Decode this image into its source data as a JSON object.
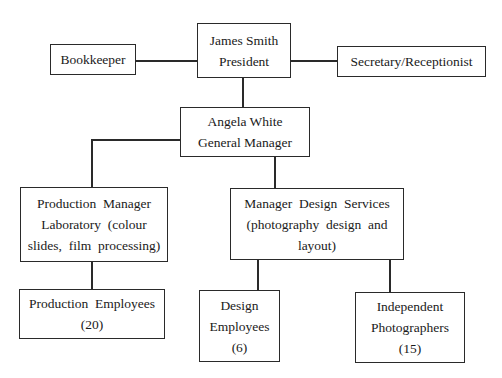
{
  "diagram": {
    "type": "org-chart",
    "nodes": {
      "president": {
        "lines": [
          "James Smith",
          "President"
        ]
      },
      "bookkeeper": {
        "lines": [
          "Bookkeeper"
        ]
      },
      "secretary": {
        "lines": [
          "Secretary/Receptionist"
        ]
      },
      "general_manager": {
        "lines": [
          "Angela White",
          "General Manager"
        ]
      },
      "production_manager": {
        "lines": [
          "Production  Manager",
          "Laboratory  (colour",
          "slides,  film  processing)"
        ]
      },
      "design_manager": {
        "lines": [
          "Manager  Design  Services",
          "(photography  design  and",
          "layout)"
        ]
      },
      "production_employees": {
        "lines": [
          "Production  Employees",
          "(20)"
        ]
      },
      "design_employees": {
        "lines": [
          "Design",
          "Employees",
          "(6)"
        ]
      },
      "independent_photographers": {
        "lines": [
          "Independent",
          "Photographers",
          "(15)"
        ]
      }
    },
    "edges": [
      [
        "president",
        "bookkeeper"
      ],
      [
        "president",
        "secretary"
      ],
      [
        "president",
        "general_manager"
      ],
      [
        "general_manager",
        "production_manager"
      ],
      [
        "general_manager",
        "design_manager"
      ],
      [
        "production_manager",
        "production_employees"
      ],
      [
        "design_manager",
        "design_employees"
      ],
      [
        "design_manager",
        "independent_photographers"
      ]
    ]
  }
}
